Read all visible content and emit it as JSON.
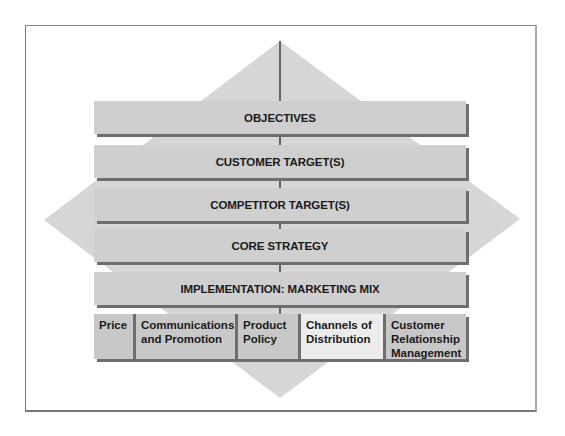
{
  "diagram": {
    "layers": [
      {
        "label": "OBJECTIVES"
      },
      {
        "label": "CUSTOMER TARGET(S)"
      },
      {
        "label": "COMPETITOR TARGET(S)"
      },
      {
        "label": "CORE STRATEGY"
      },
      {
        "label": "IMPLEMENTATION: MARKETING MIX"
      }
    ],
    "marketing_mix": [
      {
        "label": "Price",
        "highlighted": false
      },
      {
        "label": "Communications and Promotion",
        "highlighted": false
      },
      {
        "label": "Product Policy",
        "highlighted": false
      },
      {
        "label": "Channels of Distribution",
        "highlighted": true
      },
      {
        "label": "Customer Relationship Management",
        "highlighted": false
      }
    ],
    "colors": {
      "bar_fill": "#cfcfcf",
      "bar_shadow": "#6e6e6e",
      "diamond_fill": "#d6d6d6",
      "highlight_fill": "#ececec"
    }
  }
}
